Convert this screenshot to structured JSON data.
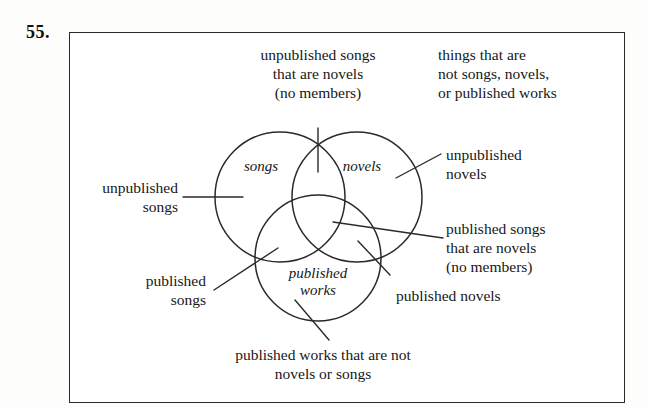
{
  "exercise": {
    "number": "55."
  },
  "diagram": {
    "type": "venn-3-circle",
    "circle_labels": [
      {
        "name": "songs",
        "text": "songs"
      },
      {
        "name": "novels",
        "text": "novels"
      },
      {
        "name": "published-works",
        "text": "published\nworks"
      }
    ],
    "region_labels": [
      {
        "name": "unpublished-songs-that-are-novels",
        "text": "unpublished songs\nthat are novels\n(no members)"
      },
      {
        "name": "things-that-are-not-songs-novels-or-published-works",
        "text": "things that are\nnot songs, novels,\nor published works"
      },
      {
        "name": "unpublished-novels",
        "text": "unpublished\nnovels"
      },
      {
        "name": "published-songs-that-are-novels",
        "text": "published songs\nthat are novels\n(no members)"
      },
      {
        "name": "unpublished-songs",
        "text": "unpublished\nsongs"
      },
      {
        "name": "published-songs",
        "text": "published\nsongs"
      },
      {
        "name": "published-novels",
        "text": "published novels"
      },
      {
        "name": "published-works-that-are-not-novels-or-songs",
        "text": "published works that are not\nnovels or songs"
      }
    ],
    "colors": {
      "ink": "#2a2a2a",
      "text": "#171717",
      "paper": "#ffffff"
    }
  }
}
